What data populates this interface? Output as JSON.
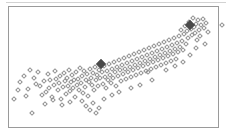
{
  "figure": {
    "width": 232,
    "height": 138,
    "background": "#ffffff",
    "frame_color": "#9a9a9a",
    "top_rule_color": "#d2d2d2",
    "marker_color": "#8f8f8f",
    "marker_highlight_color": "#4a4a4a",
    "marker_shape": "open-diamond"
  },
  "chart_data": {
    "type": "scatter",
    "title": "",
    "subtitle": "",
    "xlabel": "",
    "ylabel": "",
    "grid": false,
    "legend": "none",
    "axis_ticks": "none",
    "xlim": [
      0,
      232
    ],
    "ylim": [
      138,
      0
    ],
    "series": [
      {
        "name": "observations",
        "marker": "open-diamond",
        "color": "#8f8f8f",
        "size": 4,
        "points": [
          [
            14,
            99
          ],
          [
            20,
            82
          ],
          [
            24,
            76
          ],
          [
            28,
            89
          ],
          [
            32,
            113
          ],
          [
            34,
            78
          ],
          [
            36,
            84
          ],
          [
            38,
            72
          ],
          [
            40,
            86
          ],
          [
            42,
            95
          ],
          [
            44,
            81
          ],
          [
            46,
            92
          ],
          [
            48,
            74
          ],
          [
            49,
            88
          ],
          [
            50,
            80
          ],
          [
            52,
            97
          ],
          [
            54,
            85
          ],
          [
            55,
            71
          ],
          [
            56,
            79
          ],
          [
            58,
            90
          ],
          [
            59,
            83
          ],
          [
            60,
            76
          ],
          [
            62,
            105
          ],
          [
            63,
            87
          ],
          [
            64,
            73
          ],
          [
            65,
            81
          ],
          [
            66,
            94
          ],
          [
            67,
            78
          ],
          [
            68,
            86
          ],
          [
            69,
            70
          ],
          [
            70,
            91
          ],
          [
            71,
            82
          ],
          [
            72,
            75
          ],
          [
            73,
            88
          ],
          [
            74,
            80
          ],
          [
            75,
            97
          ],
          [
            76,
            72
          ],
          [
            77,
            85
          ],
          [
            78,
            79
          ],
          [
            79,
            90
          ],
          [
            80,
            68
          ],
          [
            81,
            83
          ],
          [
            82,
            76
          ],
          [
            83,
            93
          ],
          [
            84,
            71
          ],
          [
            85,
            87
          ],
          [
            86,
            80
          ],
          [
            87,
            74
          ],
          [
            88,
            96
          ],
          [
            89,
            82
          ],
          [
            90,
            69
          ],
          [
            91,
            78
          ],
          [
            92,
            85
          ],
          [
            93,
            73
          ],
          [
            94,
            90
          ],
          [
            95,
            67
          ],
          [
            96,
            80
          ],
          [
            97,
            75
          ],
          [
            98,
            86
          ],
          [
            99,
            70
          ],
          [
            100,
            78
          ],
          [
            102,
            72
          ],
          [
            103,
            84
          ],
          [
            104,
            66
          ],
          [
            105,
            77
          ],
          [
            106,
            88
          ],
          [
            107,
            71
          ],
          [
            108,
            80
          ],
          [
            109,
            64
          ],
          [
            110,
            75
          ],
          [
            111,
            83
          ],
          [
            112,
            69
          ],
          [
            113,
            78
          ],
          [
            114,
            62
          ],
          [
            115,
            72
          ],
          [
            116,
            86
          ],
          [
            117,
            67
          ],
          [
            118,
            76
          ],
          [
            119,
            60
          ],
          [
            120,
            70
          ],
          [
            121,
            81
          ],
          [
            122,
            65
          ],
          [
            123,
            74
          ],
          [
            124,
            58
          ],
          [
            125,
            69
          ],
          [
            126,
            79
          ],
          [
            127,
            63
          ],
          [
            128,
            72
          ],
          [
            129,
            56
          ],
          [
            130,
            67
          ],
          [
            131,
            77
          ],
          [
            132,
            61
          ],
          [
            133,
            70
          ],
          [
            134,
            54
          ],
          [
            135,
            65
          ],
          [
            136,
            75
          ],
          [
            137,
            59
          ],
          [
            138,
            68
          ],
          [
            139,
            52
          ],
          [
            140,
            63
          ],
          [
            141,
            73
          ],
          [
            142,
            57
          ],
          [
            143,
            66
          ],
          [
            144,
            50
          ],
          [
            145,
            61
          ],
          [
            146,
            71
          ],
          [
            147,
            55
          ],
          [
            148,
            64
          ],
          [
            149,
            48
          ],
          [
            150,
            59
          ],
          [
            151,
            69
          ],
          [
            152,
            53
          ],
          [
            153,
            62
          ],
          [
            154,
            46
          ],
          [
            155,
            57
          ],
          [
            156,
            67
          ],
          [
            157,
            51
          ],
          [
            158,
            60
          ],
          [
            159,
            44
          ],
          [
            160,
            55
          ],
          [
            161,
            65
          ],
          [
            162,
            49
          ],
          [
            163,
            58
          ],
          [
            164,
            42
          ],
          [
            165,
            53
          ],
          [
            166,
            63
          ],
          [
            167,
            47
          ],
          [
            168,
            56
          ],
          [
            169,
            40
          ],
          [
            170,
            51
          ],
          [
            171,
            61
          ],
          [
            172,
            45
          ],
          [
            173,
            54
          ],
          [
            174,
            38
          ],
          [
            175,
            49
          ],
          [
            176,
            59
          ],
          [
            177,
            43
          ],
          [
            178,
            52
          ],
          [
            179,
            36
          ],
          [
            180,
            47
          ],
          [
            181,
            30
          ],
          [
            182,
            41
          ],
          [
            183,
            50
          ],
          [
            184,
            34
          ],
          [
            185,
            26
          ],
          [
            186,
            44
          ],
          [
            187,
            31
          ],
          [
            188,
            38
          ],
          [
            189,
            22
          ],
          [
            191,
            29
          ],
          [
            192,
            35
          ],
          [
            193,
            18
          ],
          [
            194,
            27
          ],
          [
            195,
            33
          ],
          [
            196,
            24
          ],
          [
            197,
            40
          ],
          [
            198,
            20
          ],
          [
            199,
            30
          ],
          [
            200,
            36
          ],
          [
            201,
            25
          ],
          [
            203,
            19
          ],
          [
            204,
            28
          ],
          [
            206,
            23
          ],
          [
            208,
            32
          ],
          [
            222,
            25
          ],
          [
            18,
            90
          ],
          [
            26,
            96
          ],
          [
            30,
            70
          ],
          [
            45,
            104
          ],
          [
            53,
            100
          ],
          [
            61,
            99
          ],
          [
            70,
            102
          ],
          [
            82,
            101
          ],
          [
            93,
            103
          ],
          [
            104,
            99
          ],
          [
            112,
            95
          ],
          [
            90,
            110
          ],
          [
            96,
            113
          ],
          [
            99,
            108
          ],
          [
            86,
            106
          ],
          [
            140,
            85
          ],
          [
            152,
            80
          ],
          [
            131,
            88
          ],
          [
            119,
            92
          ],
          [
            148,
            72
          ],
          [
            166,
            70
          ],
          [
            175,
            66
          ],
          [
            183,
            62
          ],
          [
            190,
            55
          ],
          [
            196,
            48
          ],
          [
            205,
            44
          ]
        ]
      },
      {
        "name": "highlighted",
        "marker": "filled-diamond",
        "color": "#4a4a4a",
        "size": 7,
        "points": [
          [
            101,
            64
          ],
          [
            190,
            25
          ]
        ]
      }
    ]
  }
}
